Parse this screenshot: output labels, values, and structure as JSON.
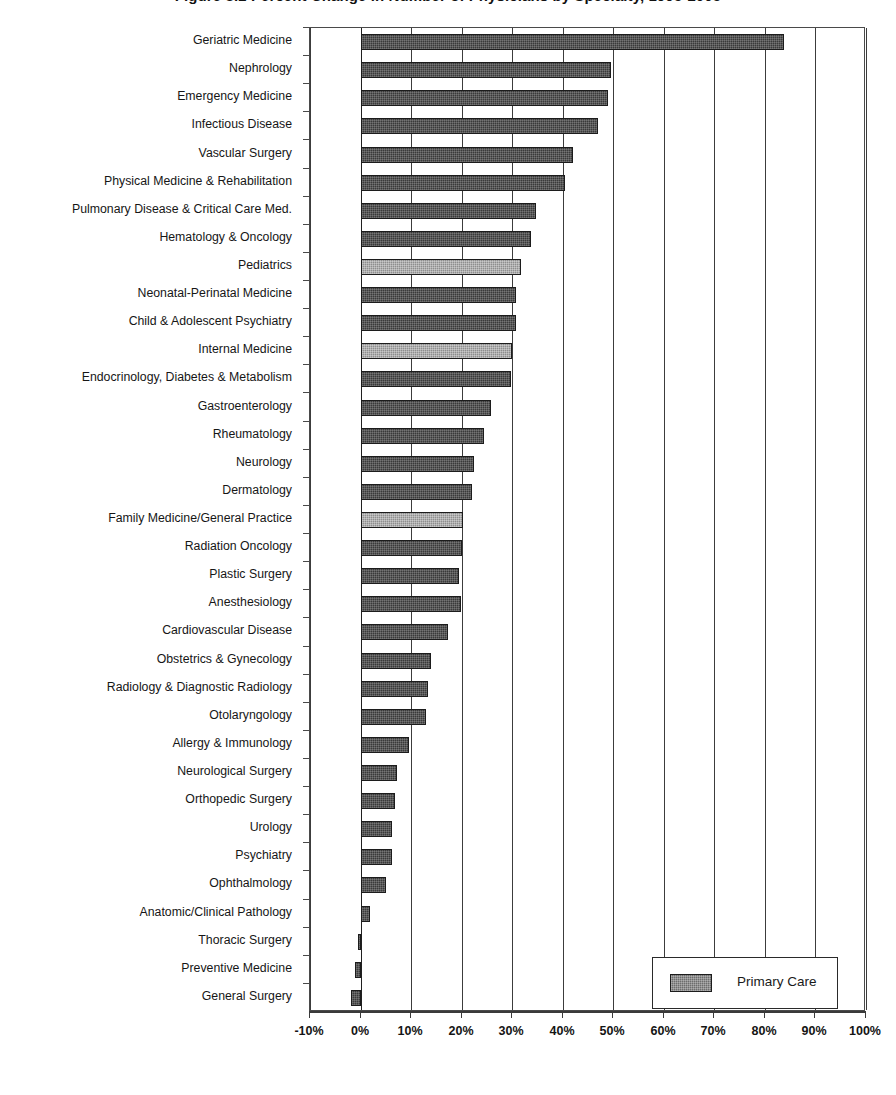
{
  "chart_data": {
    "type": "bar",
    "orientation": "horizontal",
    "title": "Figure 3.2  Percent Change in Number of Physicians by Specialty, 1995-2005",
    "xlabel": "",
    "ylabel": "",
    "xlim": [
      -10,
      100
    ],
    "xticks": [
      -10,
      0,
      10,
      20,
      30,
      40,
      50,
      60,
      70,
      80,
      90,
      100
    ],
    "xtick_labels": [
      "-10%",
      "0%",
      "10%",
      "20%",
      "30%",
      "40%",
      "50%",
      "60%",
      "70%",
      "80%",
      "90%",
      "100%"
    ],
    "grid": true,
    "grid_axis": "x",
    "legend": {
      "position": "bottom-right",
      "entries": [
        {
          "label": "Primary Care",
          "color": "#6d6d6d"
        }
      ]
    },
    "series_colors": {
      "primary_care": "#8e8e8e",
      "other": "#3a3a3a"
    },
    "categories": [
      "Geriatric Medicine",
      "Nephrology",
      "Emergency Medicine",
      "Infectious Disease",
      "Vascular Surgery",
      "Physical Medicine & Rehabilitation",
      "Pulmonary Disease & Critical Care Med.",
      "Hematology & Oncology",
      "Pediatrics",
      "Neonatal-Perinatal Medicine",
      "Child & Adolescent Psychiatry",
      "Internal Medicine",
      "Endocrinology, Diabetes & Metabolism",
      "Gastroenterology",
      "Rheumatology",
      "Neurology",
      "Dermatology",
      "Family Medicine/General Practice",
      "Radiation Oncology",
      "Plastic Surgery",
      "Anesthesiology",
      "Cardiovascular Disease",
      "Obstetrics & Gynecology",
      "Radiology & Diagnostic Radiology",
      "Otolaryngology",
      "Allergy & Immunology",
      "Neurological Surgery",
      "Orthopedic Surgery",
      "Urology",
      "Psychiatry",
      "Ophthalmology",
      "Anatomic/Clinical Pathology",
      "Thoracic Surgery",
      "Preventive Medicine",
      "General Surgery"
    ],
    "values": [
      83.8,
      49.5,
      49.0,
      47.0,
      42.0,
      40.5,
      34.8,
      33.8,
      31.8,
      30.8,
      30.8,
      30.0,
      29.8,
      25.8,
      24.5,
      22.5,
      22.0,
      20.3,
      20.0,
      19.5,
      19.8,
      17.3,
      14.0,
      13.3,
      13.0,
      9.5,
      7.3,
      6.8,
      6.3,
      6.3,
      5.0,
      1.8,
      -0.6,
      -1.0,
      -1.8
    ],
    "primary_care_flags": [
      false,
      false,
      false,
      false,
      false,
      false,
      false,
      false,
      true,
      false,
      false,
      true,
      false,
      false,
      false,
      false,
      false,
      true,
      false,
      false,
      false,
      false,
      false,
      false,
      false,
      false,
      false,
      false,
      false,
      false,
      false,
      false,
      false,
      false,
      false
    ]
  }
}
